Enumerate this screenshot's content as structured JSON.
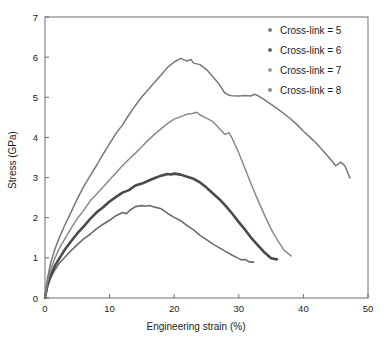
{
  "chart_data": {
    "type": "line",
    "title": "",
    "xlabel": "Engineering strain (%)",
    "ylabel": "Stress (GPa)",
    "xlim": [
      0,
      50
    ],
    "ylim": [
      0,
      7
    ],
    "xticks": [
      0,
      10,
      20,
      30,
      40,
      50
    ],
    "yticks": [
      0,
      1,
      2,
      3,
      4,
      5,
      6,
      7
    ],
    "grid": false,
    "legend_position": "top-right",
    "frame": "box",
    "series": [
      {
        "name": "Cross-link = 5",
        "legend_label": "Cross-link = 5",
        "color": "#6b6b6b",
        "width": 1.6,
        "marker": "square",
        "peak_stress": 2.3,
        "peak_strain": 15.5,
        "end_strain": 32.3,
        "end_stress": 0.9,
        "x": [
          0,
          0.4,
          0.9,
          1.5,
          2.2,
          3,
          4,
          5,
          6,
          7,
          8,
          9,
          10,
          11,
          12,
          12.6,
          13.2,
          14,
          15,
          15.5,
          16.2,
          17,
          18,
          19,
          20,
          21,
          22,
          23,
          24,
          25,
          26,
          27,
          28,
          29,
          29.8,
          30.4,
          31,
          31.6,
          32.3
        ],
        "y": [
          0,
          0.28,
          0.5,
          0.68,
          0.85,
          1.0,
          1.17,
          1.32,
          1.46,
          1.6,
          1.73,
          1.85,
          1.95,
          2.06,
          2.15,
          2.11,
          2.18,
          2.26,
          2.3,
          2.28,
          2.3,
          2.26,
          2.2,
          2.12,
          2.03,
          1.93,
          1.82,
          1.7,
          1.58,
          1.46,
          1.35,
          1.24,
          1.14,
          1.05,
          0.99,
          0.93,
          0.95,
          0.9,
          0.9
        ]
      },
      {
        "name": "Cross-link = 6",
        "legend_label": "Cross-link = 6",
        "color": "#4a4a4a",
        "width": 2.6,
        "marker": "square",
        "peak_stress": 3.1,
        "peak_strain": 19.2,
        "end_strain": 35.9,
        "end_stress": 0.95,
        "x": [
          0,
          0.4,
          0.9,
          1.5,
          2.2,
          3,
          4,
          5,
          6,
          7,
          8,
          9,
          10,
          11,
          12,
          13,
          14,
          15,
          16,
          17,
          18,
          19,
          19.5,
          20,
          21,
          22,
          23,
          24,
          25,
          26,
          27,
          28,
          29,
          30,
          31,
          32,
          33,
          34,
          35,
          35.9
        ],
        "y": [
          0,
          0.33,
          0.58,
          0.8,
          1.0,
          1.2,
          1.42,
          1.62,
          1.8,
          1.96,
          2.12,
          2.26,
          2.4,
          2.5,
          2.62,
          2.68,
          2.8,
          2.86,
          2.94,
          3.0,
          3.06,
          3.1,
          3.08,
          3.1,
          3.06,
          3.02,
          2.96,
          2.86,
          2.74,
          2.6,
          2.44,
          2.28,
          2.1,
          1.9,
          1.7,
          1.5,
          1.32,
          1.15,
          1.0,
          0.95
        ]
      },
      {
        "name": "Cross-link = 7",
        "legend_label": "Cross-link = 7",
        "color": "#8a8a8a",
        "width": 1.5,
        "marker": "square",
        "peak_stress": 4.65,
        "peak_strain": 23.5,
        "end_strain": 38.1,
        "end_stress": 1.05,
        "x": [
          0,
          0.4,
          0.9,
          1.5,
          2.2,
          3,
          4,
          5,
          6,
          7,
          8,
          9,
          10,
          11,
          12,
          13,
          14,
          15,
          16,
          17,
          18,
          19,
          20,
          21,
          22,
          22.8,
          23.5,
          24,
          25,
          26,
          27,
          27.8,
          28.5,
          29,
          30,
          31,
          32,
          33,
          34,
          35,
          36,
          37,
          38.1
        ],
        "y": [
          0,
          0.42,
          0.72,
          0.98,
          1.22,
          1.45,
          1.72,
          1.96,
          2.18,
          2.4,
          2.6,
          2.78,
          2.96,
          3.12,
          3.3,
          3.46,
          3.62,
          3.78,
          3.92,
          4.06,
          4.2,
          4.34,
          4.45,
          4.5,
          4.56,
          4.6,
          4.65,
          4.56,
          4.5,
          4.4,
          4.24,
          4.1,
          4.1,
          3.95,
          3.6,
          3.2,
          2.8,
          2.4,
          2.05,
          1.7,
          1.45,
          1.2,
          1.05
        ]
      },
      {
        "name": "Cross-link = 8",
        "legend_label": "Cross-link = 8",
        "color": "#787878",
        "width": 1.5,
        "marker": "square",
        "peak_stress": 5.98,
        "peak_strain": 21.0,
        "end_strain": 47.2,
        "end_stress": 3.0,
        "x": [
          0,
          0.4,
          0.9,
          1.5,
          2.2,
          3,
          4,
          5,
          6,
          7,
          8,
          9,
          10,
          11,
          12,
          13,
          14,
          15,
          16,
          17,
          18,
          19,
          20,
          21,
          22,
          22.6,
          23,
          24,
          25,
          26,
          27,
          27.8,
          28.5,
          29,
          30,
          31,
          31.8,
          32.5,
          33,
          34,
          35,
          36,
          37,
          38,
          39,
          40,
          41,
          42,
          43,
          44,
          45,
          45.8,
          46.4,
          47.2
        ],
        "y": [
          0,
          0.5,
          0.88,
          1.2,
          1.5,
          1.8,
          2.15,
          2.48,
          2.78,
          3.06,
          3.32,
          3.58,
          3.84,
          4.08,
          4.3,
          4.55,
          4.78,
          5.0,
          5.2,
          5.4,
          5.58,
          5.76,
          5.9,
          5.98,
          5.92,
          5.95,
          5.85,
          5.8,
          5.68,
          5.5,
          5.3,
          5.1,
          5.05,
          5.04,
          5.05,
          5.06,
          5.05,
          5.08,
          5.05,
          4.94,
          4.82,
          4.7,
          4.58,
          4.45,
          4.3,
          4.15,
          4.0,
          3.85,
          3.68,
          3.5,
          3.3,
          3.4,
          3.3,
          3.0
        ]
      }
    ]
  }
}
